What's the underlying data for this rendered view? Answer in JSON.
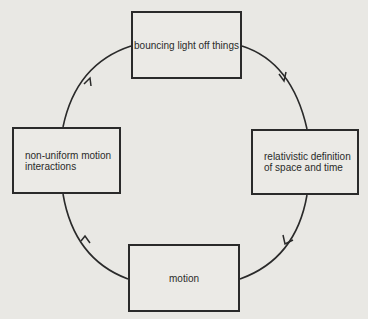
{
  "diagram": {
    "type": "cycle",
    "nodes": [
      {
        "id": "top",
        "label": "bouncing light off things"
      },
      {
        "id": "right",
        "label": "relativistic definition of space and time",
        "lines": [
          "relativistic definition",
          "of space and time"
        ]
      },
      {
        "id": "bottom",
        "label": "motion"
      },
      {
        "id": "left",
        "label": "non-uniform motion interactions",
        "lines": [
          "non-uniform motion",
          "interactions"
        ]
      }
    ],
    "edges": [
      {
        "from": "bouncing light off things",
        "to": "relativistic definition of space and time",
        "direction": "clockwise"
      },
      {
        "from": "relativistic definition of space and time",
        "to": "motion",
        "direction": "clockwise"
      },
      {
        "from": "motion",
        "to": "non-uniform motion interactions",
        "direction": "clockwise"
      },
      {
        "from": "non-uniform motion interactions",
        "to": "bouncing light off things",
        "direction": "clockwise"
      }
    ],
    "colors": {
      "line": "#2a2a2a",
      "background": "#e9e8e4"
    }
  }
}
